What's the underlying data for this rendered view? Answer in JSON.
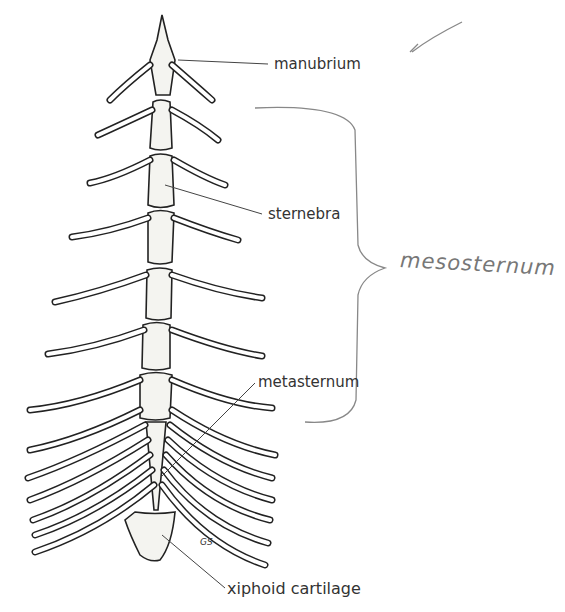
{
  "figure": {
    "labels": {
      "manubrium": "manubrium",
      "sternebra": "sternebra",
      "metasternum": "metasternum",
      "xiphoid": "xiphoid cartilage"
    },
    "handwritten": {
      "mesosternum": "mesosternum",
      "initials": "GS"
    },
    "colors": {
      "bone_stroke": "#222222",
      "bone_fill": "#f4f4f0",
      "annotation": "#888888"
    }
  }
}
